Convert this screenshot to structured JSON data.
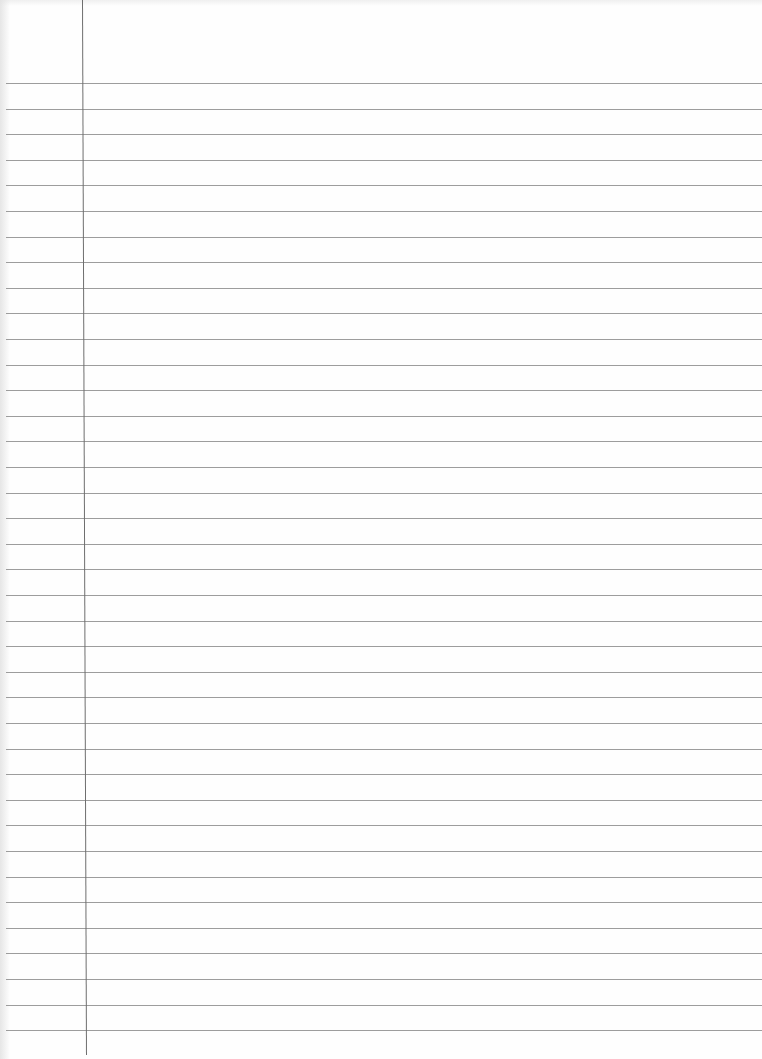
{
  "page": {
    "type": "ruled-notebook-paper",
    "width": 762,
    "height": 1059,
    "paper_color": "#fefefe",
    "line_color": "#8c8c8c",
    "margin_color": "#6e6e6e"
  },
  "rules": {
    "count": 38,
    "first_y": 83,
    "spacing": 25.6
  },
  "margin": {
    "x_top": 82,
    "x_bottom": 86
  }
}
